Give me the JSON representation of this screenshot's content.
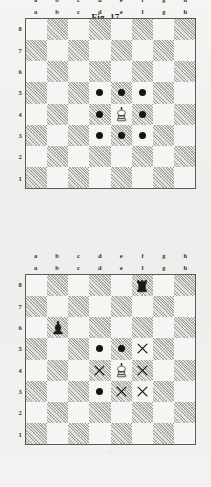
{
  "page": {
    "background_color": "#f2f1ef",
    "light_square_color": "#f6f5f3",
    "dark_square_color": "#eceae6",
    "border_color": "#5d5a55",
    "marker_color": "#16140f"
  },
  "files": [
    "a",
    "b",
    "c",
    "d",
    "e",
    "f",
    "g",
    "h"
  ],
  "ranks": [
    "8",
    "7",
    "6",
    "5",
    "4",
    "3",
    "2",
    "1"
  ],
  "figures": [
    {
      "id": "figure-1",
      "caption": "Fig. 17",
      "pieces": [
        {
          "square": "e4",
          "piece": "white-king",
          "glyph": "♔"
        }
      ],
      "markers": [
        {
          "square": "d5",
          "type": "dot"
        },
        {
          "square": "e5",
          "type": "dot"
        },
        {
          "square": "f5",
          "type": "dot"
        },
        {
          "square": "d4",
          "type": "dot"
        },
        {
          "square": "f4",
          "type": "dot"
        },
        {
          "square": "d3",
          "type": "dot"
        },
        {
          "square": "e3",
          "type": "dot"
        },
        {
          "square": "f3",
          "type": "dot"
        }
      ]
    },
    {
      "id": "figure-2",
      "caption": "",
      "pieces": [
        {
          "square": "f8",
          "piece": "black-rook",
          "glyph": "♜"
        },
        {
          "square": "b6",
          "piece": "black-bishop",
          "glyph": "♝"
        },
        {
          "square": "e4",
          "piece": "white-king",
          "glyph": "♔"
        }
      ],
      "markers": [
        {
          "square": "d5",
          "type": "dot"
        },
        {
          "square": "e5",
          "type": "dot"
        },
        {
          "square": "f5",
          "type": "cross"
        },
        {
          "square": "d4",
          "type": "cross"
        },
        {
          "square": "f4",
          "type": "cross"
        },
        {
          "square": "d3",
          "type": "dot"
        },
        {
          "square": "e3",
          "type": "cross"
        },
        {
          "square": "f3",
          "type": "cross"
        }
      ]
    }
  ]
}
